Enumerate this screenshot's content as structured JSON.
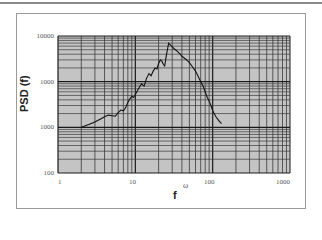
{
  "chart_data": {
    "type": "line",
    "title": "",
    "xlabel": "f",
    "ylabel": "PSD (f)",
    "annotation": "ω",
    "xscale": "log",
    "yscale": "log",
    "xlim": [
      1,
      1000
    ],
    "ylim": [
      10,
      10000
    ],
    "x_ticks": [
      "1",
      "10",
      "100",
      "1000"
    ],
    "y_ticks": [
      "10000",
      "1000",
      "1000",
      "100"
    ],
    "grid": true,
    "legend": null,
    "series": [
      {
        "name": "PSD",
        "x": [
          2.0,
          2.5,
          3.0,
          3.5,
          4.0,
          4.5,
          5.0,
          5.5,
          6.0,
          6.5,
          7.0,
          7.5,
          8.0,
          8.5,
          9.0,
          9.5,
          10,
          11,
          12,
          13,
          14,
          15,
          16,
          17,
          18,
          19,
          20,
          21,
          22,
          23,
          24,
          25,
          26,
          27,
          28,
          30,
          32,
          35,
          38,
          40,
          45,
          50,
          55,
          60,
          65,
          70,
          75,
          80,
          85,
          90,
          95,
          100,
          110,
          120,
          130
        ],
        "values": [
          100,
          115,
          130,
          150,
          170,
          185,
          180,
          175,
          210,
          240,
          230,
          270,
          350,
          420,
          480,
          450,
          520,
          700,
          900,
          800,
          1200,
          1500,
          1350,
          1700,
          2000,
          1900,
          2500,
          3000,
          2800,
          2400,
          2200,
          3500,
          5000,
          7000,
          6500,
          5800,
          5200,
          4600,
          4000,
          3600,
          3100,
          2600,
          2100,
          1700,
          1300,
          1000,
          800,
          600,
          450,
          380,
          300,
          230,
          170,
          140,
          120
        ]
      }
    ]
  },
  "axes": {
    "y_title": "PSD (f)",
    "x_title": "f",
    "omega_label": "ω",
    "y_tick_labels": [
      "10000",
      "1000",
      "1000",
      "100"
    ],
    "x_tick_labels": [
      "1",
      "10",
      "100",
      "1000"
    ]
  },
  "colors": {
    "plot_background": "#c4c4c4",
    "grid_major": "#1a1a1a",
    "grid_minor": "#3a3a3a",
    "line": "#111111",
    "frame": "#9a9a9a"
  }
}
